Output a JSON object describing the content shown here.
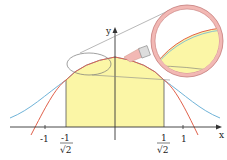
{
  "diagram": {
    "axes": {
      "x_label": "x",
      "y_label": "y"
    },
    "tick_labels": {
      "neg_one": "-1",
      "one": "1",
      "neg_inv_sqrt2_num": "-1",
      "inv_sqrt2_num": "1",
      "sqrt2_den": "√2"
    },
    "curves": [
      {
        "name": "gaussian",
        "color": "#6fb3d8"
      },
      {
        "name": "approximation",
        "color": "#e0604a"
      }
    ],
    "shaded_region": {
      "from": "-1/√2",
      "to": "1/√2",
      "color": "#fbf6a6"
    },
    "magnifier": {
      "rim_color": "#f2b8b4",
      "lens_fill": "#ffffff"
    }
  }
}
